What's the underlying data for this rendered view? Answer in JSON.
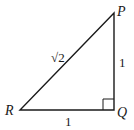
{
  "diagram": {
    "type": "right-triangle",
    "vertices": {
      "P": {
        "label": "P",
        "x": 114,
        "y": 13
      },
      "Q": {
        "label": "Q",
        "x": 114,
        "y": 110
      },
      "R": {
        "label": "R",
        "x": 20,
        "y": 110
      }
    },
    "right_angle_at": "Q",
    "sides": {
      "RQ": {
        "label": "1"
      },
      "QP": {
        "label": "1"
      },
      "RP": {
        "label": "√2"
      }
    },
    "colors": {
      "stroke": "#1a1a1a",
      "background": "#ffffff"
    }
  }
}
